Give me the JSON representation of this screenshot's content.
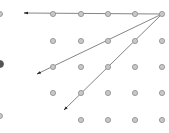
{
  "diagram": {
    "type": "dot-grid-with-arrows",
    "colors": {
      "dot_fill": "#c8c8c8",
      "dot_stroke": "#8c8c8c",
      "edge_dot_dark": "#555555",
      "arrow": "#777777",
      "arrowhead": "#222222"
    },
    "dots": [
      {
        "x": 53,
        "y": 14
      },
      {
        "x": 81,
        "y": 14
      },
      {
        "x": 108,
        "y": 14
      },
      {
        "x": 135,
        "y": 14
      },
      {
        "x": 162,
        "y": 14
      },
      {
        "x": 53,
        "y": 41
      },
      {
        "x": 81,
        "y": 41
      },
      {
        "x": 108,
        "y": 41
      },
      {
        "x": 135,
        "y": 41
      },
      {
        "x": 162,
        "y": 41
      },
      {
        "x": 53,
        "y": 67
      },
      {
        "x": 81,
        "y": 67
      },
      {
        "x": 108,
        "y": 67
      },
      {
        "x": 135,
        "y": 67
      },
      {
        "x": 162,
        "y": 67
      },
      {
        "x": 53,
        "y": 93
      },
      {
        "x": 81,
        "y": 93
      },
      {
        "x": 108,
        "y": 93
      },
      {
        "x": 135,
        "y": 93
      },
      {
        "x": 162,
        "y": 93
      },
      {
        "x": 81,
        "y": 120
      },
      {
        "x": 108,
        "y": 120
      },
      {
        "x": 135,
        "y": 120
      },
      {
        "x": 162,
        "y": 120
      }
    ],
    "edge_dots": [
      {
        "x": 0,
        "y": 14,
        "dark": false
      },
      {
        "x": 0,
        "y": 64,
        "dark": true
      },
      {
        "x": 0,
        "y": 116,
        "dark": false
      }
    ],
    "origin": {
      "x": 162,
      "y": 14
    },
    "arrows": [
      {
        "to_x": 24,
        "to_y": 13
      },
      {
        "to_x": 37,
        "to_y": 74
      },
      {
        "to_x": 64,
        "to_y": 110
      }
    ]
  }
}
